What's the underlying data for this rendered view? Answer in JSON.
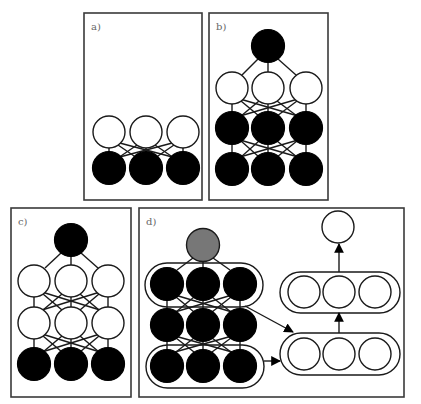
{
  "figure": {
    "colors": {
      "black_node": "#000000",
      "white_node": "#ffffff",
      "gray_node": "#777777",
      "border": "#3a3a3a",
      "label": "#666666"
    }
  },
  "panels": {
    "a": {
      "label": "a)",
      "rows": [
        {
          "fill": "white",
          "count": 3
        },
        {
          "fill": "black",
          "count": 3
        }
      ]
    },
    "b": {
      "label": "b)",
      "rows": [
        {
          "fill": "black",
          "count": 1
        },
        {
          "fill": "white",
          "count": 3
        },
        {
          "fill": "black",
          "count": 3
        },
        {
          "fill": "black",
          "count": 3
        }
      ]
    },
    "c": {
      "label": "c)",
      "rows": [
        {
          "fill": "black",
          "count": 1
        },
        {
          "fill": "white",
          "count": 3
        },
        {
          "fill": "white",
          "count": 3
        },
        {
          "fill": "black",
          "count": 3
        }
      ]
    },
    "d": {
      "label": "d)",
      "left_stack": {
        "top": {
          "fill": "gray",
          "count": 1
        },
        "rows": [
          {
            "fill": "black",
            "count": 3,
            "grouped": true
          },
          {
            "fill": "black",
            "count": 3,
            "grouped": false
          },
          {
            "fill": "black",
            "count": 3,
            "grouped": true
          }
        ]
      },
      "right_stack": {
        "top": {
          "fill": "white",
          "count": 1
        },
        "rows": [
          {
            "fill": "white",
            "count": 3,
            "grouped": true
          },
          {
            "fill": "white",
            "count": 3,
            "grouped": true
          }
        ]
      },
      "arrows": [
        "top-group to lower-right-group (diagonal)",
        "bottom-group to lower-right-group (horizontal)",
        "lower-right-group to upper-right-group (up)",
        "upper-right-group to top-right-node (up)"
      ]
    }
  }
}
